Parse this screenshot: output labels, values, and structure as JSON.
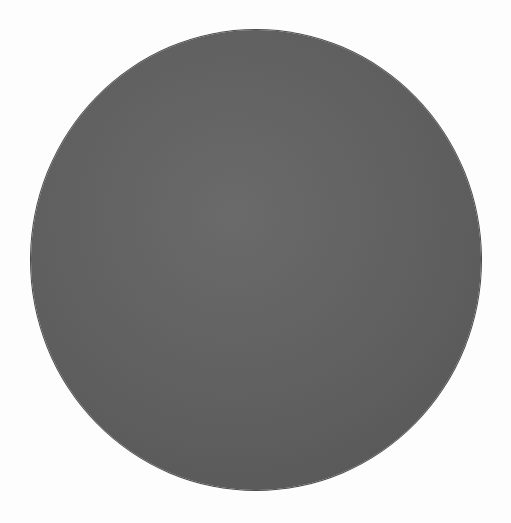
{
  "shape": {
    "type": "circle",
    "fill_color": "#626262",
    "background_color": "#fdfdfd"
  }
}
